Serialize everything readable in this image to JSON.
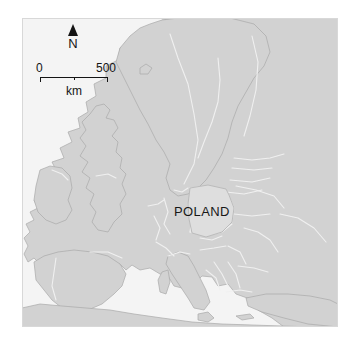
{
  "figure": {
    "type": "locator-map",
    "region": "Europe",
    "background_color": "#ffffff",
    "frame": {
      "x": 22,
      "y": 18,
      "width": 316,
      "height": 309,
      "border_color": "#d8d8d8"
    }
  },
  "map": {
    "water_color": "#f4f4f4",
    "land_color": "#d2d2d2",
    "land_outline_color": "#a9a9a9",
    "border_color": "#f0f0f0",
    "highlight_color": "#dedede",
    "highlight_outline_color": "#bbbbbb",
    "labels": [
      {
        "name": "country-label-poland",
        "text": "POLAND",
        "x": 184,
        "y": 193,
        "color": "#181818"
      }
    ]
  },
  "north_arrow": {
    "label": "N",
    "icon": "north-arrow-triangle-icon",
    "color": "#141414"
  },
  "scale_bar": {
    "min_label": "0",
    "max_label": "500",
    "unit_label": "km",
    "color": "#141414"
  }
}
